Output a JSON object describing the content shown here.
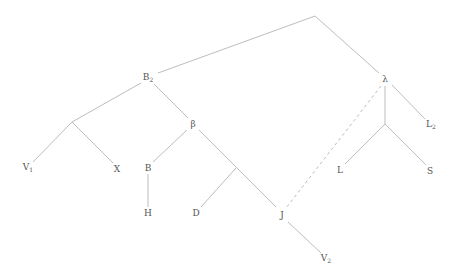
{
  "diagram": {
    "type": "syntax-tree",
    "edge_color": "#bdbdbd",
    "label_color": "#555555",
    "nodes": [
      {
        "id": "root",
        "label": "",
        "sub": "",
        "x": 315,
        "y": 16
      },
      {
        "id": "b2",
        "label": "B",
        "sub": "2",
        "x": 148,
        "y": 78
      },
      {
        "id": "lambda",
        "label": "λ",
        "sub": "",
        "x": 385,
        "y": 79
      },
      {
        "id": "l2",
        "label": "L",
        "sub": "2",
        "x": 431,
        "y": 125
      },
      {
        "id": "left-junction",
        "label": "",
        "sub": "",
        "x": 72,
        "y": 122
      },
      {
        "id": "v1",
        "label": "V",
        "sub": "1",
        "x": 28,
        "y": 168
      },
      {
        "id": "x",
        "label": "X",
        "sub": "",
        "x": 117,
        "y": 169
      },
      {
        "id": "beta",
        "label": "β",
        "sub": "",
        "x": 193,
        "y": 124
      },
      {
        "id": "b",
        "label": "B",
        "sub": "",
        "x": 148,
        "y": 168
      },
      {
        "id": "h",
        "label": "H",
        "sub": "",
        "x": 148,
        "y": 213
      },
      {
        "id": "mid-junction",
        "label": "",
        "sub": "",
        "x": 236,
        "y": 168
      },
      {
        "id": "d",
        "label": "D",
        "sub": "",
        "x": 196,
        "y": 213
      },
      {
        "id": "j",
        "label": "J",
        "sub": "",
        "x": 282,
        "y": 215
      },
      {
        "id": "v2",
        "label": "V",
        "sub": "2",
        "x": 326,
        "y": 259
      },
      {
        "id": "lambda-junction",
        "label": "",
        "sub": "",
        "x": 385,
        "y": 124
      },
      {
        "id": "l",
        "label": "L",
        "sub": "",
        "x": 340,
        "y": 170
      },
      {
        "id": "s",
        "label": "S",
        "sub": "",
        "x": 430,
        "y": 171
      }
    ],
    "edges": [
      {
        "from": "root",
        "to": "b2",
        "style": "solid"
      },
      {
        "from": "root",
        "to": "lambda",
        "style": "solid"
      },
      {
        "from": "b2",
        "to": "left-junction",
        "style": "solid"
      },
      {
        "from": "b2",
        "to": "beta",
        "style": "solid"
      },
      {
        "from": "left-junction",
        "to": "v1",
        "style": "solid"
      },
      {
        "from": "left-junction",
        "to": "x",
        "style": "solid"
      },
      {
        "from": "beta",
        "to": "b",
        "style": "solid"
      },
      {
        "from": "beta",
        "to": "j",
        "style": "solid"
      },
      {
        "from": "b",
        "to": "h",
        "style": "solid"
      },
      {
        "from": "mid-junction",
        "to": "d",
        "style": "solid"
      },
      {
        "from": "j",
        "to": "v2",
        "style": "solid"
      },
      {
        "from": "lambda",
        "to": "l2",
        "style": "solid"
      },
      {
        "from": "lambda",
        "to": "lambda-junction",
        "style": "solid"
      },
      {
        "from": "lambda-junction",
        "to": "l",
        "style": "solid"
      },
      {
        "from": "lambda-junction",
        "to": "s",
        "style": "solid"
      },
      {
        "from": "lambda",
        "to": "j",
        "style": "dashed"
      }
    ]
  }
}
